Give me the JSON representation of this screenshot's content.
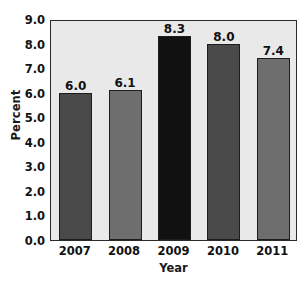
{
  "chart_data": {
    "type": "bar",
    "title": "",
    "xlabel": "Year",
    "ylabel": "Percent",
    "categories": [
      "2007",
      "2008",
      "2009",
      "2010",
      "2011"
    ],
    "values": [
      6.0,
      6.1,
      8.3,
      8.0,
      7.4
    ],
    "value_labels": [
      "6.0",
      "6.1",
      "8.3",
      "8.0",
      "7.4"
    ],
    "ylim": [
      0.0,
      9.0
    ],
    "ytick_labels": [
      "0.0",
      "1.0",
      "2.0",
      "3.0",
      "4.0",
      "5.0",
      "6.0",
      "7.0",
      "8.0",
      "9.0"
    ],
    "ytick_values": [
      0.0,
      1.0,
      2.0,
      3.0,
      4.0,
      5.0,
      6.0,
      7.0,
      8.0,
      9.0
    ],
    "grid": false,
    "legend": "none",
    "bar_colors": [
      "#4a4a4a",
      "#6e6e6e",
      "#111111",
      "#4a4a4a",
      "#6e6e6e"
    ],
    "highlight_category": "2009",
    "plot_background": "#e9e9e9",
    "page_background": "#ffffff",
    "axis_color": "#2b2b2b"
  }
}
